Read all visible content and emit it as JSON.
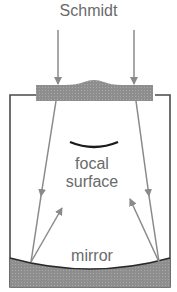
{
  "diagram": {
    "title": "Schmidt",
    "labels": {
      "focal_line1": "focal",
      "focal_line2": "surface",
      "mirror": "mirror"
    },
    "icons": {
      "arrows": "incoming-light-arrows",
      "corrector": "corrector-plate",
      "focal_surface": "curved-focal-surface",
      "mirror": "spherical-mirror"
    },
    "colors": {
      "ray": "#8a8a8a",
      "plate": "#8c8c8c",
      "tube": "#4a4a4a",
      "focal_curve": "#1a1a1a",
      "text": "#6a6a6a"
    }
  }
}
